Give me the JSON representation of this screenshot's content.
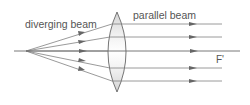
{
  "labels": {
    "diverging": "diverging beam",
    "parallel": "parallel beam",
    "focus": "F'"
  },
  "colors": {
    "ray": "#777777",
    "arrow": "#666666",
    "lens_fill": "#e6e6e6",
    "lens_stroke": "#666666",
    "text": "#555555"
  },
  "geometry": {
    "source_point": [
      26,
      51
    ],
    "lens_center_x": 117,
    "lens_top_y": 12,
    "lens_bottom_y": 92,
    "ray_heights": [
      24,
      37,
      51,
      68,
      81
    ],
    "axis_end_x": 240,
    "parallel_end_x": 222
  }
}
